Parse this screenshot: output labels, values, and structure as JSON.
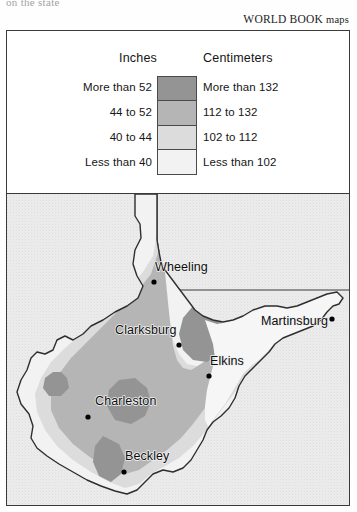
{
  "page": {
    "cut_headline": "on the state",
    "credit": "WORLD BOOK maps",
    "credit_brand": "WORLD BOOK",
    "credit_suffix": "maps"
  },
  "legend": {
    "column_headers": {
      "inches": "Inches",
      "centimeters": "Centimeters"
    },
    "bands": [
      {
        "inches": "More than 52",
        "centimeters": "More than 132",
        "color": "#949494"
      },
      {
        "inches": "44 to 52",
        "centimeters": "112 to 132",
        "color": "#b5b5b5"
      },
      {
        "inches": "40 to 44",
        "centimeters": "102 to 112",
        "color": "#dcdcdc"
      },
      {
        "inches": "Less than 40",
        "centimeters": "Less than 102",
        "color": "#f2f2f2"
      }
    ]
  },
  "map": {
    "cities": [
      {
        "name": "Wheeling",
        "label_x": 148,
        "label_y": 77,
        "dot_x": 147,
        "dot_y": 88,
        "anchor": "start"
      },
      {
        "name": "Clarksburg",
        "label_x": 108,
        "label_y": 140,
        "dot_x": 172,
        "dot_y": 151,
        "anchor": "start"
      },
      {
        "name": "Martinsburg",
        "label_x": 254,
        "label_y": 131,
        "dot_x": 325,
        "dot_y": 125,
        "anchor": "start"
      },
      {
        "name": "Elkins",
        "label_x": 203,
        "label_y": 171,
        "dot_x": 202,
        "dot_y": 182,
        "anchor": "start"
      },
      {
        "name": "Charleston",
        "label_x": 88,
        "label_y": 211,
        "dot_x": 81,
        "dot_y": 223,
        "anchor": "start"
      },
      {
        "name": "Beckley",
        "label_x": 118,
        "label_y": 266,
        "dot_x": 117,
        "dot_y": 278,
        "anchor": "start"
      }
    ],
    "colors": {
      "outside_fill": "#e7e7e7",
      "band_lightest": "#f2f2f2",
      "band_light": "#dcdcdc",
      "band_mid": "#b5b5b5",
      "band_dark": "#949494",
      "boundary_line": "#3a3a3a"
    }
  }
}
